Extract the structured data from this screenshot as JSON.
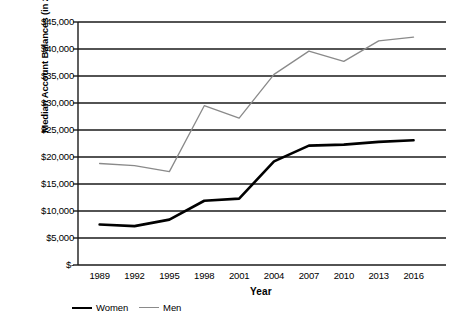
{
  "chart_data": {
    "type": "line",
    "title": "",
    "xlabel": "Year",
    "ylabel": "Median Account Balances (in 2016 Dollars)",
    "x": [
      1989,
      1992,
      1995,
      1998,
      2001,
      2004,
      2007,
      2010,
      2013,
      2016
    ],
    "categories": [
      "1989",
      "1992",
      "1995",
      "1998",
      "2001",
      "2004",
      "2007",
      "2010",
      "2013",
      "2016"
    ],
    "series": [
      {
        "name": "Women",
        "color": "#000000",
        "values": [
          7500,
          7200,
          8400,
          11900,
          12300,
          19200,
          22100,
          22300,
          22800,
          23100
        ]
      },
      {
        "name": "Men",
        "color": "#8a8a8a",
        "values": [
          18800,
          18400,
          17300,
          29500,
          27200,
          35300,
          39600,
          37700,
          41500,
          42200
        ]
      }
    ],
    "ylim": [
      0,
      45000
    ],
    "yticks": [
      0,
      5000,
      10000,
      15000,
      20000,
      25000,
      30000,
      35000,
      40000,
      45000
    ],
    "ytick_labels": [
      "$-",
      "$5,000",
      "$10,000",
      "$15,000",
      "$20,000",
      "$25,000",
      "$30,000",
      "$35,000",
      "$40,000",
      "$45,000"
    ],
    "grid": "horizontal",
    "legend_position": "bottom-left"
  }
}
